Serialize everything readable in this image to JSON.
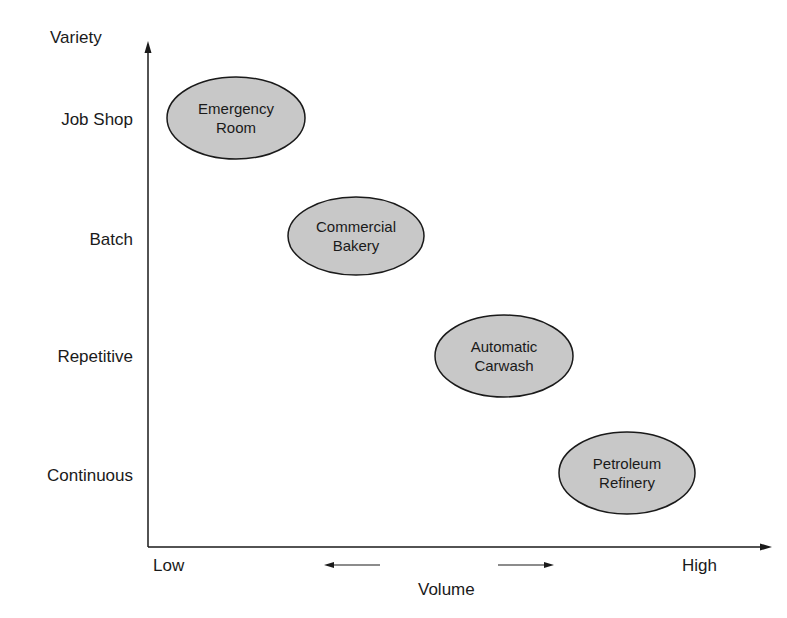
{
  "diagram": {
    "y_axis": {
      "title": "Variety",
      "levels": [
        "Job Shop",
        "Batch",
        "Repetitive",
        "Continuous"
      ]
    },
    "x_axis": {
      "title": "Volume",
      "low_label": "Low",
      "high_label": "High"
    },
    "processes": [
      {
        "line1": "Emergency",
        "line2": "Room",
        "level": "Job Shop"
      },
      {
        "line1": "Commercial",
        "line2": "Bakery",
        "level": "Batch"
      },
      {
        "line1": "Automatic",
        "line2": "Carwash",
        "level": "Repetitive"
      },
      {
        "line1": "Petroleum",
        "line2": "Refinery",
        "level": "Continuous"
      }
    ],
    "colors": {
      "ellipse_fill": "#c8c8c8",
      "ellipse_stroke": "#1a1a1a",
      "axis": "#1a1a1a"
    }
  }
}
